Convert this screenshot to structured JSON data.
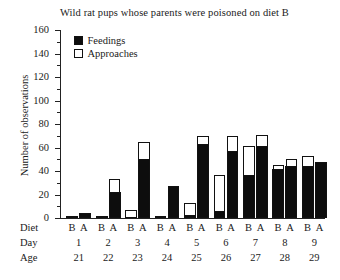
{
  "chart_data": {
    "type": "bar",
    "title": "Wild rat pups whose parents were poisoned on diet B",
    "xlabel": "",
    "ylabel": "Number of observations",
    "ylim": [
      0,
      160
    ],
    "ytick_step": 20,
    "yminor_step": 10,
    "yticks": [
      0,
      20,
      40,
      60,
      80,
      100,
      120,
      140,
      160
    ],
    "grid": false,
    "legend_position": "top-left-inside",
    "stacked": true,
    "legend": [
      "Feedings",
      "Approaches"
    ],
    "categories": [
      "1",
      "2",
      "3",
      "4",
      "5",
      "6",
      "7",
      "8",
      "9"
    ],
    "row_labels": {
      "diet": "Diet",
      "day": "Day",
      "age": "Age"
    },
    "diet_pair": [
      "B",
      "A"
    ],
    "day": [
      "1",
      "2",
      "3",
      "4",
      "5",
      "6",
      "7",
      "8",
      "9"
    ],
    "age": [
      "21",
      "22",
      "23",
      "24",
      "25",
      "26",
      "27",
      "28",
      "29"
    ],
    "series": [
      {
        "name": "Feedings",
        "color": "#0d0d0d",
        "diet_B": [
          0,
          1,
          0,
          0,
          3,
          6,
          37,
          42,
          44
        ],
        "diet_A": [
          4,
          22,
          50,
          27,
          63,
          57,
          61,
          44,
          48
        ]
      },
      {
        "name": "Approaches",
        "color": "#ffffff",
        "diet_B_total": [
          1,
          2,
          7,
          2,
          13,
          37,
          61,
          45,
          53
        ],
        "diet_A_total": [
          4,
          33,
          65,
          27,
          70,
          70,
          71,
          50,
          48
        ]
      }
    ]
  },
  "colors": {
    "feedings": "#0d0d0d",
    "approaches": "#ffffff",
    "axis": "#222222",
    "background": "#ffffff"
  }
}
